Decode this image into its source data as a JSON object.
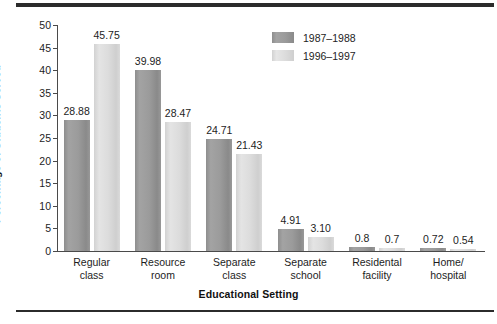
{
  "chart_data": {
    "type": "bar",
    "title": "",
    "xlabel": "Educational Setting",
    "ylabel": "Percentage of Students Served",
    "ylim": [
      0,
      50
    ],
    "ytick_step": 5,
    "yticks": [
      "0",
      "5",
      "10",
      "15",
      "20",
      "25",
      "30",
      "35",
      "40",
      "45",
      "50"
    ],
    "grid": false,
    "legend_position": "upper-right-inside",
    "categories": [
      "Regular\nclass",
      "Resource\nroom",
      "Separate\nclass",
      "Separate\nschool",
      "Residental\nfacility",
      "Home/\nhospital"
    ],
    "series": [
      {
        "name": "1987–1988",
        "color": "#9b9b9b",
        "values": [
          28.88,
          39.98,
          24.71,
          4.91,
          0.8,
          0.72
        ],
        "labels": [
          "28.88",
          "39.98",
          "24.71",
          "4.91",
          "0.8",
          "0.72"
        ]
      },
      {
        "name": "1996–1997",
        "color": "#dcdcdc",
        "values": [
          45.75,
          28.47,
          21.43,
          3.1,
          0.7,
          0.54
        ],
        "labels": [
          "45.75",
          "28.47",
          "21.43",
          "3.10",
          "0.7",
          "0.54"
        ]
      }
    ]
  }
}
